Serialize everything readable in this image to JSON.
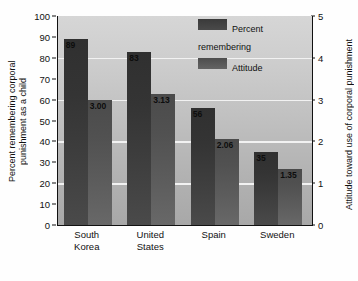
{
  "chart_data": {
    "type": "bar",
    "title": "",
    "subtitle": "",
    "categories": [
      "South\nKorea",
      "United\nStates",
      "Spain",
      "Sweden"
    ],
    "series": [
      {
        "name": "Percent\nremembering",
        "legend_label": "Percent\nremembering",
        "axis": "left",
        "values": [
          89,
          83,
          56,
          35
        ],
        "value_labels": [
          "89",
          "83",
          "56",
          "35"
        ],
        "color": "#3a3a3a"
      },
      {
        "name": "Attitude",
        "legend_label": "Attitude",
        "axis": "right",
        "values": [
          3.0,
          3.13,
          2.06,
          1.35
        ],
        "value_labels": [
          "3.00",
          "3.13",
          "2.06",
          "1.35"
        ],
        "color": "#575757"
      }
    ],
    "xlabel": "",
    "ylabel": "Percent remembering corporal\npunishment as a child",
    "y2label": "Attitude toward use of corporal punishment",
    "ylim": [
      0,
      100
    ],
    "y2lim": [
      0,
      5
    ],
    "yticks": [
      "100",
      "90",
      "80",
      "70",
      "60",
      "50",
      "40",
      "30",
      "20",
      "10",
      "0"
    ],
    "y2ticks": [
      "5",
      "4",
      "3",
      "2",
      "1",
      "0"
    ],
    "grid": true,
    "gridlines_at": [
      20,
      40,
      60,
      80
    ],
    "legend_position": "top-right",
    "background_color": "#c4c4c4",
    "gridline_color": "#f2f2f2",
    "axis_color": "#111111"
  }
}
